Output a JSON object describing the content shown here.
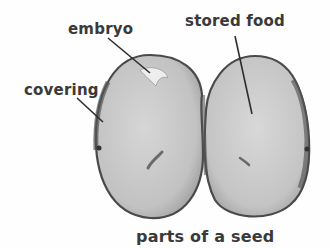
{
  "diagram": {
    "caption": "parts of a seed",
    "labels": {
      "embryo": "embryo",
      "stored_food": "stored food",
      "covering": "covering"
    }
  },
  "colors": {
    "label_text": "#3a3a3a",
    "seed_fill": "#c9c9c9",
    "seed_edge": "#4a4a4a",
    "leader_line": "#2e2e2e",
    "background": "#fefefe"
  }
}
